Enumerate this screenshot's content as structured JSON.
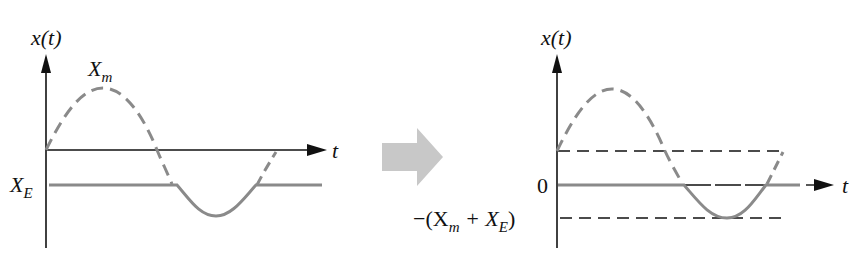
{
  "colors": {
    "axis": "#111111",
    "curve": "#8a8a8a",
    "arrow": "#c8c8c8",
    "background": "#ffffff"
  },
  "left_panel": {
    "y_axis_label": "x(t)",
    "x_axis_label": "t",
    "amplitude_label": "X",
    "amplitude_sub": "m",
    "saturation_label": "X",
    "saturation_sub": "E"
  },
  "transition_arrow": {
    "icon": "right-arrow-icon"
  },
  "right_panel": {
    "y_axis_label": "x(t)",
    "x_axis_label": "t",
    "zero_label": "0",
    "lower_label_prefix": "−(X",
    "lower_label_sub1": "m",
    "lower_label_mid": " + X",
    "lower_label_sub2": "E",
    "lower_label_suffix": ")"
  }
}
